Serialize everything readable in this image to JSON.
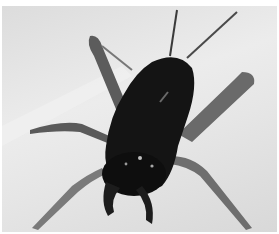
{
  "image": {
    "subject": "cricket",
    "alt": "Black-and-white close-up photograph of a cricket viewed from behind on a light surface",
    "colors": {
      "background": "#e6e6e6",
      "body": "#141414",
      "legs": "#6a6a6a",
      "highlight": "#bfbfbf"
    }
  }
}
